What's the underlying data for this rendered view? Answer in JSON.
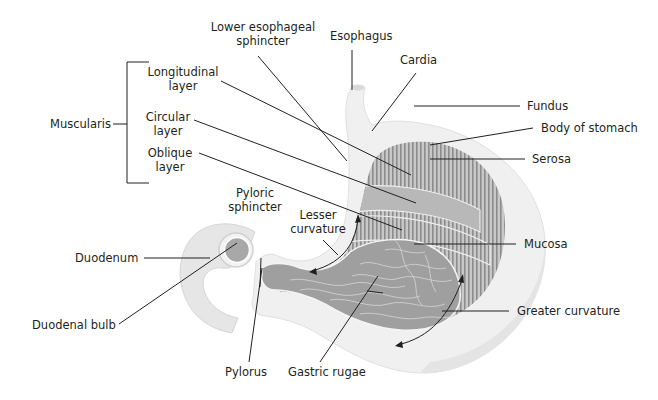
{
  "diagram": {
    "colors": {
      "line": "#231f20",
      "outer_wall": "#ededed",
      "outer_wall_shadow": "#dcdcdc",
      "muscle_stripe": "#8c8c8c",
      "muscle_band": "#b4b4b4",
      "mucosa": "#9a9a9a",
      "rugae": "#d8d8d8",
      "text": "#231f20"
    },
    "group": {
      "name": "Muscularis",
      "members": [
        "Longitudinal layer",
        "Circular layer",
        "Oblique layer"
      ]
    },
    "labels": {
      "lower_esophageal_sphincter_1": "Lower esophageal",
      "lower_esophageal_sphincter_2": "sphincter",
      "esophagus": "Esophagus",
      "cardia": "Cardia",
      "fundus": "Fundus",
      "body_of_stomach": "Body of stomach",
      "serosa": "Serosa",
      "muscularis": "Muscularis",
      "longitudinal_1": "Longitudinal",
      "longitudinal_2": "layer",
      "circular_1": "Circular",
      "circular_2": "layer",
      "oblique_1": "Oblique",
      "oblique_2": "layer",
      "pyloric_sphincter_1": "Pyloric",
      "pyloric_sphincter_2": "sphincter",
      "lesser_curvature_1": "Lesser",
      "lesser_curvature_2": "curvature",
      "mucosa": "Mucosa",
      "duodenum": "Duodenum",
      "duodenal_bulb": "Duodenal bulb",
      "greater_curvature": "Greater curvature",
      "pylorus": "Pylorus",
      "gastric_rugae": "Gastric rugae"
    }
  }
}
